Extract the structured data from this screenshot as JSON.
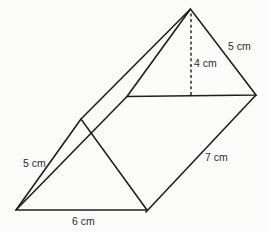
{
  "figure": {
    "type": "triangular-prism-diagram",
    "colors": {
      "line": "#1f1f1f",
      "text": "#2e2e2e",
      "background": "#fcfcfa"
    },
    "labels": {
      "top_slant_edge": "5 cm",
      "triangle_height": "4 cm",
      "prism_length": "7 cm",
      "front_slant_edge": "5 cm",
      "base": "6 cm"
    },
    "measurements": {
      "triangle_slant_cm": 5,
      "triangle_height_cm": 4,
      "prism_length_cm": 7,
      "base_cm": 6
    }
  }
}
